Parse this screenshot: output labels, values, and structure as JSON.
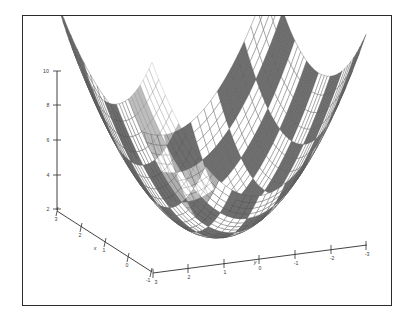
{
  "figure": {
    "title": "",
    "background_color": "#ffffff",
    "frame_color": "#2b2b2b"
  },
  "chart_data": {
    "type": "surface",
    "title": "",
    "xlabel": "x",
    "ylabel": "y",
    "zlabel": "",
    "function": "z = x^2 + y^2 (elliptic paraboloid)",
    "colormap": "checkerboard-grayscale",
    "grid": true,
    "legend": "none",
    "projection": "3d",
    "shading": "faceted",
    "mesh_line_color": "#555555",
    "checker_dark_color": "#6e6e6e",
    "checker_light_color": "#ffffff",
    "axes": {
      "x": {
        "label": "x",
        "ticks": [
          3,
          2,
          1,
          0,
          -1
        ],
        "tick_labels": [
          "3",
          "2",
          "1",
          "0",
          "-1"
        ],
        "range": [
          -1,
          3
        ],
        "position": "lower-left"
      },
      "y": {
        "label": "y",
        "ticks": [
          3,
          2,
          1,
          0,
          -1,
          -2,
          -3
        ],
        "tick_labels": [
          "3",
          "2",
          "1",
          "0",
          "-1",
          "-2",
          "-3"
        ],
        "range": [
          -3,
          3
        ],
        "position": "lower-right"
      },
      "z": {
        "label": "",
        "ticks": [
          2,
          4,
          6,
          8,
          10
        ],
        "tick_labels": [
          "2",
          "4",
          "6",
          "8",
          "10"
        ],
        "range": [
          2,
          10
        ],
        "position": "left-vertical"
      }
    },
    "surface_samples": {
      "x": [
        -1,
        -0.5,
        0,
        0.5,
        1,
        1.5,
        2,
        2.5,
        3
      ],
      "y": [
        -3,
        -2.25,
        -1.5,
        -0.75,
        0,
        0.75,
        1.5,
        2.25,
        3
      ],
      "z_corners": {
        "x_min_y_min": 10,
        "x_min_y_max": 10,
        "x_max_y_min": 18,
        "x_max_y_max": 18,
        "center": 0
      }
    }
  },
  "axis_labels": {
    "x_name": "x",
    "y_name": "y"
  },
  "z_ticks": [
    "10",
    "8",
    "6",
    "4",
    "2"
  ],
  "x_ticks": [
    "3",
    "2",
    "1",
    "0",
    "-1"
  ],
  "y_ticks": [
    "3",
    "2",
    "1",
    "0",
    "-1",
    "-2",
    "-3"
  ]
}
